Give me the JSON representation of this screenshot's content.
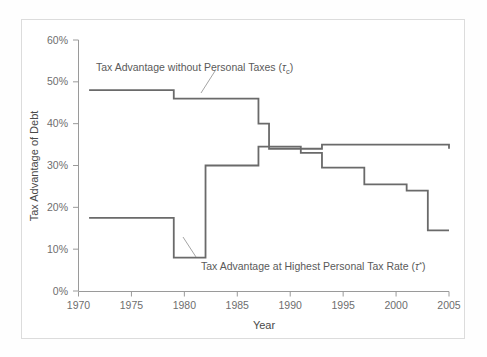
{
  "figure": {
    "background_color": "#ffffff",
    "frame_color": "#dcdcdc"
  },
  "chart_data": {
    "type": "line",
    "title": "",
    "xlabel": "Year",
    "ylabel": "Tax Advantage of Debt",
    "xlim": [
      1970,
      2005
    ],
    "ylim": [
      0,
      0.6
    ],
    "grid": false,
    "legend_position": "inline-annotations",
    "x_ticks": [
      1970,
      1975,
      1980,
      1985,
      1990,
      1995,
      2000,
      2005
    ],
    "x_tick_labels": [
      "1970",
      "1975",
      "1980",
      "1985",
      "1990",
      "1995",
      "2000",
      "2005"
    ],
    "y_ticks": [
      0,
      0.1,
      0.2,
      0.3,
      0.4,
      0.5,
      0.6
    ],
    "y_tick_labels": [
      "0%",
      "10%",
      "20%",
      "30%",
      "40%",
      "50%",
      "60%"
    ],
    "line_color": "#6a6a6a",
    "line_width": 1.8,
    "step_style": "post",
    "series": [
      {
        "name": "Tax Advantage without Personal Taxes",
        "symbol": "tau_c",
        "label_text": "Tax Advantage without Personal Taxes (",
        "label_symbol": "τ",
        "label_subscript": "c",
        "label_close": ")",
        "color": "#6a6a6a",
        "x": [
          1971,
          1979,
          1987,
          1988,
          1993,
          2005
        ],
        "values": [
          0.48,
          0.46,
          0.4,
          0.34,
          0.35,
          0.34
        ],
        "points": [
          {
            "year": 1971,
            "value": 0.48
          },
          {
            "year": 1979,
            "value": 0.46
          },
          {
            "year": 1987,
            "value": 0.4
          },
          {
            "year": 1988,
            "value": 0.34
          },
          {
            "year": 1993,
            "value": 0.35
          },
          {
            "year": 2005,
            "value": 0.34
          }
        ]
      },
      {
        "name": "Tax Advantage at Highest Personal Tax Rate",
        "symbol": "tau_star",
        "label_text": "Tax Advantage at Highest Personal Tax Rate (",
        "label_symbol": "τ",
        "label_superscript": "*",
        "label_close": ")",
        "color": "#6a6a6a",
        "x": [
          1971,
          1979,
          1982,
          1987,
          1991,
          1993,
          1997,
          2001,
          2003,
          2005
        ],
        "values": [
          0.175,
          0.08,
          0.3,
          0.345,
          0.33,
          0.295,
          0.255,
          0.24,
          0.145,
          0.145
        ],
        "points": [
          {
            "year": 1971,
            "value": 0.175
          },
          {
            "year": 1979,
            "value": 0.08
          },
          {
            "year": 1982,
            "value": 0.3
          },
          {
            "year": 1987,
            "value": 0.345
          },
          {
            "year": 1991,
            "value": 0.33
          },
          {
            "year": 1993,
            "value": 0.295
          },
          {
            "year": 1997,
            "value": 0.255
          },
          {
            "year": 2001,
            "value": 0.24
          },
          {
            "year": 2003,
            "value": 0.145
          },
          {
            "year": 2005,
            "value": 0.145
          }
        ]
      }
    ],
    "annotations": [
      {
        "id": "upper-annotation",
        "text": "Tax Advantage without Personal Taxes (τc)",
        "leader_line": true
      },
      {
        "id": "lower-annotation",
        "text": "Tax Advantage at Highest Personal Tax Rate (τ*)",
        "leader_line": true
      }
    ]
  }
}
